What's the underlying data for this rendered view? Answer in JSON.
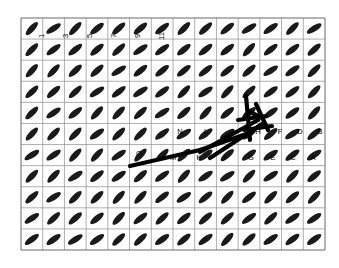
{
  "figure": {
    "background_color": "#ffffff",
    "grid": {
      "x0": 21,
      "y0": 18,
      "x1": 325,
      "y1": 250,
      "cols": 14,
      "rows": 11,
      "line_color": "#8c8c8c",
      "border_color": "#6b6b6b",
      "line_width": 0.7,
      "visible": true
    },
    "elements": {
      "shape": "ellipse",
      "fill_color": "#1a1a1a",
      "rx": 8.5,
      "ry": 3.0,
      "default_angle_deg": -40,
      "cols": 14,
      "rows": 11,
      "note": "oriented texture elements tiled over the grid"
    },
    "path_overlay": {
      "stroke_color": "#000000",
      "stroke_width": 4.2,
      "segments": [
        [
          [
            130,
            166
          ],
          [
            200,
            150
          ]
        ],
        [
          [
            200,
            150
          ],
          [
            252,
            132
          ]
        ],
        [
          [
            200,
            152
          ],
          [
            258,
            120
          ]
        ],
        [
          [
            210,
            158
          ],
          [
            262,
            124
          ]
        ],
        [
          [
            246,
            96
          ],
          [
            250,
            140
          ]
        ],
        [
          [
            250,
            112
          ],
          [
            262,
            118
          ]
        ],
        [
          [
            256,
            104
          ],
          [
            268,
            130
          ]
        ],
        [
          [
            238,
            120
          ],
          [
            266,
            116
          ]
        ],
        [
          [
            244,
            130
          ],
          [
            272,
            126
          ]
        ]
      ]
    },
    "number_labels": [
      {
        "text": "1",
        "x": 44,
        "y": 36,
        "rot": -90
      },
      {
        "text": "3",
        "x": 68,
        "y": 36,
        "rot": -90
      },
      {
        "text": "5",
        "x": 92,
        "y": 36,
        "rot": -90
      },
      {
        "text": "7",
        "x": 116,
        "y": 36,
        "rot": -90
      },
      {
        "text": "9",
        "x": 140,
        "y": 36,
        "rot": -90
      },
      {
        "text": "11",
        "x": 164,
        "y": 36,
        "rot": -90
      }
    ],
    "letter_labels": [
      {
        "text": "O",
        "x": 139,
        "y": 156
      },
      {
        "text": "M",
        "x": 173,
        "y": 160
      },
      {
        "text": "N",
        "x": 180,
        "y": 134
      },
      {
        "text": "K",
        "x": 199,
        "y": 160
      },
      {
        "text": "L",
        "x": 206,
        "y": 134
      },
      {
        "text": "I",
        "x": 225,
        "y": 160
      },
      {
        "text": "J",
        "x": 232,
        "y": 134
      },
      {
        "text": "G",
        "x": 251,
        "y": 160
      },
      {
        "text": "H",
        "x": 258,
        "y": 134
      },
      {
        "text": "E",
        "x": 273,
        "y": 160
      },
      {
        "text": "F",
        "x": 280,
        "y": 134
      },
      {
        "text": "C",
        "x": 293,
        "y": 160
      },
      {
        "text": "D",
        "x": 300,
        "y": 134
      },
      {
        "text": "A",
        "x": 313,
        "y": 160
      },
      {
        "text": "B",
        "x": 320,
        "y": 134
      }
    ]
  }
}
